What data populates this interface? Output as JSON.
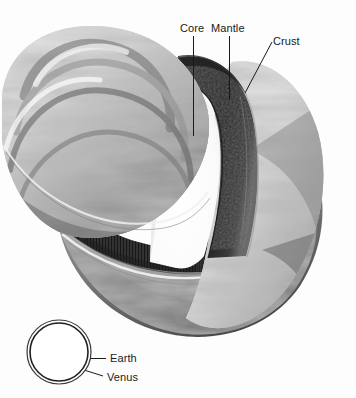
{
  "figure": {
    "background_color": "#fdfdfd",
    "width": 356,
    "height": 398
  },
  "labels": {
    "core": "Core",
    "mantle": "Mantle",
    "crust": "Crust",
    "earth": "Earth",
    "venus": "Venus"
  },
  "leaders": {
    "core": {
      "x1": 193,
      "y1": 36,
      "x2": 193,
      "y2": 136
    },
    "mantle": {
      "x1": 229,
      "y1": 36,
      "x2": 229,
      "y2": 100
    },
    "crust": {
      "x1": 272,
      "y1": 42,
      "x2": 245,
      "y2": 93
    },
    "earth": {
      "x1": 106,
      "y1": 358,
      "x2": 91,
      "y2": 358
    },
    "venus": {
      "x1": 103,
      "y1": 376,
      "x2": 84,
      "y2": 370
    }
  },
  "inset": {
    "name": "size-comparison",
    "outer_circle": {
      "cx": 59,
      "cy": 352,
      "r": 32,
      "planet": "Earth"
    },
    "inner_circle": {
      "cx": 59,
      "cy": 352,
      "r": 29,
      "planet": "Venus"
    },
    "stroke_color": "#2b2b2b"
  },
  "palette": {
    "cloud_light": "#f4f4f4",
    "cloud_mid": "#b9b9b9",
    "cloud_dark": "#6e6e6e",
    "mantle_dark": "#3a3a3a",
    "mantle_darkest": "#242424",
    "core_cavity": "#fbfbfb",
    "shadow": "#4a4a4a",
    "label_color": "#1a1a1a"
  }
}
